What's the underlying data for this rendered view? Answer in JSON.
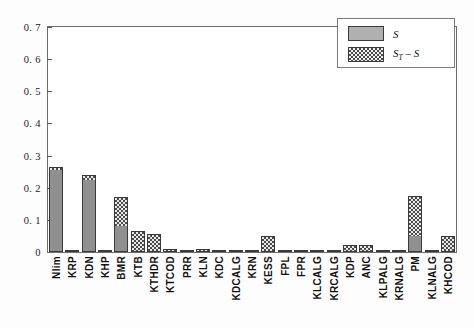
{
  "chart_data": {
    "type": "bar",
    "stacked": true,
    "title": "",
    "xlabel": "",
    "ylabel": "",
    "ylim": [
      0,
      0.7
    ],
    "ytick_labels": [
      "0",
      "0. 1",
      "0. 2",
      "0. 3",
      "0. 4",
      "0. 5",
      "0. 6",
      "0. 7"
    ],
    "ytick_values": [
      0,
      0.1,
      0.2,
      0.3,
      0.4,
      0.5,
      0.6,
      0.7
    ],
    "grid": false,
    "legend_position": "top-right",
    "categories": [
      "Nlim",
      "KRP",
      "KDN",
      "KHP",
      "BMR",
      "KTB",
      "KTHDR",
      "KTCOD",
      "PRR",
      "KLN",
      "KDC",
      "KDCALG",
      "KRN",
      "KESS",
      "FPL",
      "FPR",
      "KLCALG",
      "KRCALG",
      "KDP",
      "ANC",
      "KLPALG",
      "KRNALG",
      "PM",
      "KLNALG",
      "KHCOD"
    ],
    "series": [
      {
        "name": "S",
        "values": [
          0.255,
          0.003,
          0.225,
          0.003,
          0.08,
          0.004,
          0.004,
          0.003,
          0.002,
          0.004,
          0.002,
          0.002,
          0.002,
          0.003,
          0.002,
          0.002,
          0.002,
          0.002,
          0.002,
          0.002,
          0.002,
          0.002,
          0.05,
          0.002,
          0.002
        ]
      },
      {
        "name": "S_T - S",
        "values": [
          0.01,
          0.002,
          0.015,
          0.002,
          0.09,
          0.061,
          0.051,
          0.005,
          0.003,
          0.004,
          0.003,
          0.003,
          0.003,
          0.047,
          0.003,
          0.003,
          0.003,
          0.003,
          0.02,
          0.02,
          0.003,
          0.003,
          0.125,
          0.003,
          0.048
        ]
      }
    ],
    "totals": [
      0.265,
      0.005,
      0.24,
      0.005,
      0.17,
      0.065,
      0.055,
      0.008,
      0.005,
      0.008,
      0.005,
      0.005,
      0.005,
      0.05,
      0.005,
      0.005,
      0.005,
      0.005,
      0.022,
      0.022,
      0.005,
      0.005,
      0.175,
      0.005,
      0.05
    ]
  },
  "legend": {
    "items": [
      {
        "label": "S",
        "sub": "",
        "style": "solid"
      },
      {
        "label_main": "S",
        "label_sub": "T",
        "label_tail": " – S",
        "style": "hatch"
      }
    ]
  },
  "colors": {
    "bar_solid": "#909090",
    "bar_hatch_dark": "#4a4a4a",
    "bar_hatch_light": "#e8e8e8",
    "axis": "#6e6e6e",
    "text": "#111111",
    "background": "#ffffff"
  }
}
